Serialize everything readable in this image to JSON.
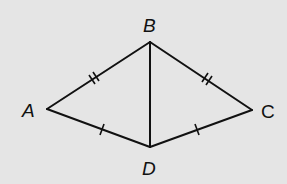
{
  "diagram": {
    "type": "geometry-figure",
    "background": "#e5e5e5",
    "stroke": "#111111",
    "vertices": {
      "A": {
        "label": "A",
        "x": 47,
        "y": 109
      },
      "B": {
        "label": "B",
        "x": 150,
        "y": 42
      },
      "C": {
        "label": "C",
        "x": 252,
        "y": 110
      },
      "D": {
        "label": "D",
        "x": 150,
        "y": 147
      }
    },
    "segments": [
      {
        "from": "A",
        "to": "B",
        "ticks": 2
      },
      {
        "from": "B",
        "to": "C",
        "ticks": 2
      },
      {
        "from": "A",
        "to": "D",
        "ticks": 1
      },
      {
        "from": "D",
        "to": "C",
        "ticks": 1
      },
      {
        "from": "B",
        "to": "D",
        "ticks": 0
      }
    ]
  }
}
